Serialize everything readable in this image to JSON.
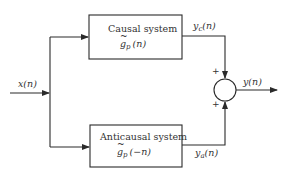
{
  "diagram": {
    "type": "block-diagram",
    "input": {
      "label": "x(n)"
    },
    "blocks": [
      {
        "id": "causal",
        "title": "Causal system",
        "func_base": "g",
        "func_sub": "p",
        "func_arg": "(n)",
        "output_base": "y",
        "output_sub": "c",
        "output_arg": "(n)"
      },
      {
        "id": "anticausal",
        "title": "Anticausal system",
        "func_base": "g",
        "func_sub": "p",
        "func_arg": "(−n)",
        "output_base": "y",
        "output_sub": "a",
        "output_arg": "(n)"
      }
    ],
    "summer": {
      "top_sign": "+",
      "bottom_sign": "+"
    },
    "output": {
      "label": "y(n)"
    },
    "colors": {
      "line": "#2a2a2a",
      "text": "#333333",
      "background": "#ffffff"
    }
  }
}
